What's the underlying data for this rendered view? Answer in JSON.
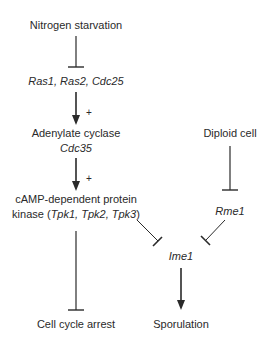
{
  "diagram": {
    "type": "signaling-pathway",
    "nodes": {
      "nitrogen": {
        "label": "Nitrogen starvation"
      },
      "ras": {
        "label": "Ras1, Ras2, Cdc25"
      },
      "adenylate": {
        "label": "Adenylate cyclase"
      },
      "cdc35": {
        "label": "Cdc35"
      },
      "pka_line1": {
        "label": "cAMP-dependent protein"
      },
      "pka_prefix": {
        "label": "kinase ("
      },
      "pka_genes": {
        "label": "Tpk1, Tpk2, Tpk3"
      },
      "pka_suffix": {
        "label": ")"
      },
      "diploid": {
        "label": "Diploid cell"
      },
      "rme1": {
        "label": "Rme1"
      },
      "ime1": {
        "label": "Ime1"
      },
      "arrest": {
        "label": "Cell cycle arrest"
      },
      "sporulation": {
        "label": "Sporulation"
      }
    },
    "edges": [
      {
        "from": "Nitrogen starvation",
        "to": "Ras1, Ras2, Cdc25",
        "type": "inhibits"
      },
      {
        "from": "Ras1, Ras2, Cdc25",
        "to": "Adenylate cyclase",
        "type": "activates",
        "sign": "+"
      },
      {
        "from": "Adenylate cyclase",
        "to": "cAMP-dependent protein kinase",
        "type": "activates",
        "sign": "+"
      },
      {
        "from": "cAMP-dependent protein kinase",
        "to": "Cell cycle arrest",
        "type": "inhibits"
      },
      {
        "from": "cAMP-dependent protein kinase",
        "to": "Ime1",
        "type": "inhibits"
      },
      {
        "from": "Diploid cell",
        "to": "Rme1",
        "type": "inhibits"
      },
      {
        "from": "Rme1",
        "to": "Ime1",
        "type": "inhibits"
      },
      {
        "from": "Ime1",
        "to": "Sporulation",
        "type": "activates"
      }
    ],
    "signs": {
      "plus1": "+",
      "plus2": "+"
    },
    "colors": {
      "line": "#2a2a2a",
      "text": "#2a2a2a",
      "background": "#ffffff"
    }
  }
}
